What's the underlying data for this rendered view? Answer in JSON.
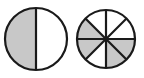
{
  "figure": {
    "background_color": "#ffffff",
    "width": 144,
    "height": 78,
    "shaded_color": "#c8c8c8",
    "unshaded_color": "#ffffff",
    "stroke_color": "#1a1a1a",
    "outline_width": 2.2,
    "divider_width": 2.2
  },
  "circles": [
    {
      "name": "half-circle-diagram",
      "label": "1/2",
      "center_x": 36,
      "center_y": 39,
      "radius": 31,
      "total_parts": 2,
      "shaded_parts": 1,
      "fraction_text": "1/2",
      "sector_angle_deg": 180,
      "start_angle_deg": 90,
      "sectors": [
        {
          "index": 0,
          "shaded": true,
          "start_deg": 90,
          "end_deg": 270
        },
        {
          "index": 1,
          "shaded": false,
          "start_deg": 270,
          "end_deg": 450
        }
      ],
      "divider_lines": [
        {
          "angle_deg": 90
        }
      ]
    },
    {
      "name": "eighths-circle-diagram",
      "label": "4/8",
      "center_x": 106,
      "center_y": 39,
      "radius": 29,
      "total_parts": 8,
      "shaded_parts": 4,
      "fraction_text": "4/8",
      "sector_angle_deg": 45,
      "start_angle_deg": 90,
      "sectors": [
        {
          "index": 0,
          "shaded": false,
          "start_deg": 90,
          "end_deg": 135
        },
        {
          "index": 1,
          "shaded": true,
          "start_deg": 135,
          "end_deg": 180
        },
        {
          "index": 2,
          "shaded": true,
          "start_deg": 180,
          "end_deg": 225
        },
        {
          "index": 3,
          "shaded": false,
          "start_deg": 225,
          "end_deg": 270
        },
        {
          "index": 4,
          "shaded": true,
          "start_deg": 270,
          "end_deg": 315
        },
        {
          "index": 5,
          "shaded": true,
          "start_deg": 315,
          "end_deg": 360
        },
        {
          "index": 6,
          "shaded": false,
          "start_deg": 0,
          "end_deg": 45
        },
        {
          "index": 7,
          "shaded": false,
          "start_deg": 45,
          "end_deg": 90
        }
      ],
      "divider_lines": [
        {
          "angle_deg": 0
        },
        {
          "angle_deg": 45
        },
        {
          "angle_deg": 90
        },
        {
          "angle_deg": 135
        }
      ]
    }
  ]
}
